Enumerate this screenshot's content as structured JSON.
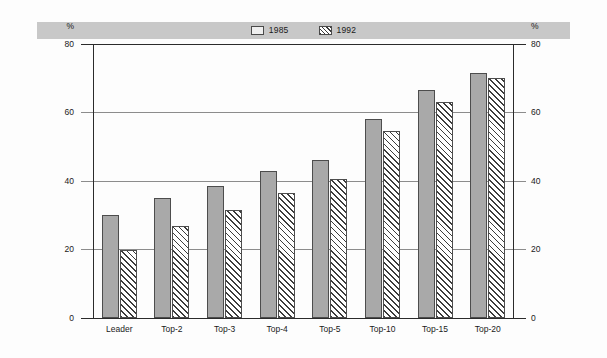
{
  "chart_data": {
    "type": "bar",
    "title": "",
    "xlabel": "",
    "ylabel": "%",
    "ylabel_right": "%",
    "ylim": [
      0,
      80
    ],
    "yticks": [
      0,
      20,
      40,
      60,
      80
    ],
    "ytick_labels": [
      "0",
      "20",
      "40",
      "60",
      "80"
    ],
    "grid": true,
    "legend_position": "top-center",
    "categories": [
      "Leader",
      "Top-2",
      "Top-3",
      "Top-4",
      "Top-5",
      "Top-10",
      "Top-15",
      "Top-20"
    ],
    "series": [
      {
        "name": "1985",
        "fill": "solid-gray",
        "color": "#a9a9a9",
        "values": [
          30,
          35,
          38.5,
          43,
          46,
          58,
          66.5,
          71.5
        ]
      },
      {
        "name": "1992",
        "fill": "diagonal-hatch",
        "color": "#ffffff",
        "values": [
          20,
          27,
          31.5,
          36.5,
          40.5,
          54.5,
          63,
          70
        ]
      }
    ]
  },
  "axes": {
    "left_unit": "%",
    "right_unit": "%",
    "ticks": [
      {
        "value": 80,
        "label": "80"
      },
      {
        "value": 60,
        "label": "60"
      },
      {
        "value": 40,
        "label": "40"
      },
      {
        "value": 20,
        "label": "20"
      },
      {
        "value": 0,
        "label": "0"
      }
    ]
  },
  "legend": {
    "entries": [
      {
        "label": "1985",
        "swatch": "solid-swatch-icon"
      },
      {
        "label": "1992",
        "swatch": "hatch-swatch-icon"
      }
    ]
  },
  "colors": {
    "series_1985": "#a9a9a9",
    "series_1992_hatch": "#3c3c3c",
    "legend_band": "#c8c8c8",
    "gridline": "#8c8c8c",
    "axis": "#2b2b2b",
    "background": "#fdfdfd"
  }
}
